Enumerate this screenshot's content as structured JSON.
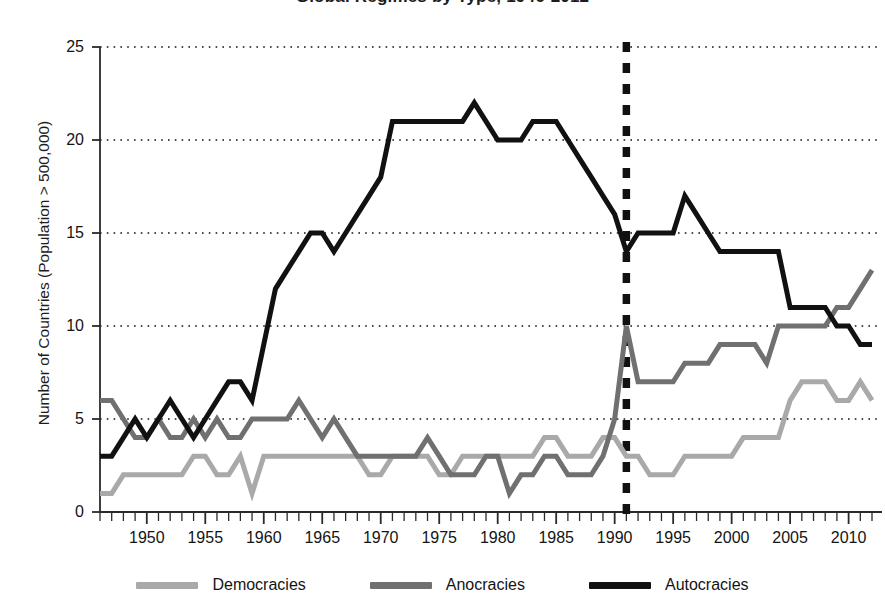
{
  "chart_data": {
    "type": "line",
    "title": "Global Regimes by Type, 1946-2012",
    "xlabel": "",
    "ylabel": "Number of Countries (Population > 500,000)",
    "xlim": [
      1946,
      2012
    ],
    "ylim": [
      0,
      25
    ],
    "yticks": [
      0,
      5,
      10,
      15,
      20,
      25
    ],
    "xticks": [
      1950,
      1955,
      1960,
      1965,
      1970,
      1975,
      1980,
      1985,
      1990,
      1995,
      2000,
      2005,
      2010
    ],
    "x_minor_tick_interval": 1,
    "grid": "horizontal-dotted",
    "legend_position": "bottom-center",
    "x": [
      1946,
      1947,
      1948,
      1949,
      1950,
      1951,
      1952,
      1953,
      1954,
      1955,
      1956,
      1957,
      1958,
      1959,
      1960,
      1961,
      1962,
      1963,
      1964,
      1965,
      1966,
      1967,
      1968,
      1969,
      1970,
      1971,
      1972,
      1973,
      1974,
      1975,
      1976,
      1977,
      1978,
      1979,
      1980,
      1981,
      1982,
      1983,
      1984,
      1985,
      1986,
      1987,
      1988,
      1989,
      1990,
      1991,
      1992,
      1993,
      1994,
      1995,
      1996,
      1997,
      1998,
      1999,
      2000,
      2001,
      2002,
      2003,
      2004,
      2005,
      2006,
      2007,
      2008,
      2009,
      2010,
      2011,
      2012
    ],
    "series": [
      {
        "name": "Democracies",
        "color": "#a9a9a9",
        "values": [
          1,
          1,
          2,
          2,
          2,
          2,
          2,
          2,
          3,
          3,
          2,
          2,
          3,
          1,
          3,
          3,
          3,
          3,
          3,
          3,
          3,
          3,
          3,
          2,
          2,
          3,
          3,
          3,
          3,
          2,
          2,
          3,
          3,
          3,
          3,
          3,
          3,
          3,
          4,
          4,
          3,
          3,
          3,
          4,
          4,
          3,
          3,
          2,
          2,
          2,
          3,
          3,
          3,
          3,
          3,
          4,
          4,
          4,
          4,
          6,
          7,
          7,
          7,
          6,
          6,
          7,
          6
        ]
      },
      {
        "name": "Anocracies",
        "color": "#707070",
        "values": [
          6,
          6,
          5,
          4,
          4,
          5,
          4,
          4,
          5,
          4,
          5,
          4,
          4,
          5,
          5,
          5,
          5,
          6,
          5,
          4,
          5,
          4,
          3,
          3,
          3,
          3,
          3,
          3,
          4,
          3,
          2,
          2,
          2,
          3,
          3,
          1,
          2,
          2,
          3,
          3,
          2,
          2,
          2,
          3,
          5,
          10,
          7,
          7,
          7,
          7,
          8,
          8,
          8,
          9,
          9,
          9,
          9,
          8,
          10,
          10,
          10,
          10,
          10,
          11,
          11,
          12,
          13
        ]
      },
      {
        "name": "Autocracies",
        "color": "#111111",
        "values": [
          3,
          3,
          4,
          5,
          4,
          5,
          6,
          5,
          4,
          5,
          6,
          7,
          7,
          6,
          9,
          12,
          13,
          14,
          15,
          15,
          14,
          15,
          16,
          17,
          18,
          21,
          21,
          21,
          21,
          21,
          21,
          21,
          22,
          21,
          20,
          20,
          20,
          21,
          21,
          21,
          20,
          19,
          18,
          17,
          16,
          14,
          15,
          15,
          15,
          15,
          17,
          16,
          15,
          14,
          14,
          14,
          14,
          14,
          14,
          11,
          11,
          11,
          11,
          10,
          10,
          9,
          9
        ]
      }
    ],
    "annotations": [
      {
        "name": "end-of-cold-war-marker",
        "type": "vertical-dashed-line",
        "x": 1991,
        "color": "#111111"
      }
    ]
  },
  "legend": {
    "items": [
      {
        "label": "Democracies",
        "color": "#a9a9a9"
      },
      {
        "label": "Anocracies",
        "color": "#707070"
      },
      {
        "label": "Autocracies",
        "color": "#111111"
      }
    ]
  }
}
